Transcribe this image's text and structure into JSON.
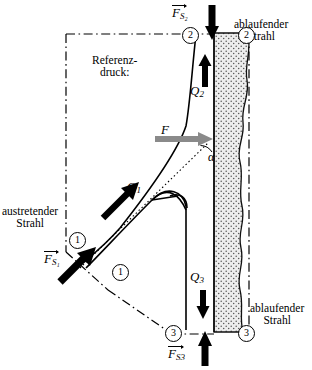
{
  "figure": {
    "type": "technical-diagram",
    "width": 312,
    "height": 370,
    "background": "#ffffff"
  },
  "labels": {
    "reference_pressure_line1": "Referenz-",
    "reference_pressure_line2": "druck:",
    "exiting_jet_line1": "austretender",
    "exiting_jet_line2": "Strahl",
    "running_jet_top_line1": "ablaufender",
    "running_jet_top_line2": "Strahl",
    "running_jet_bottom_line1": "ablaufender",
    "running_jet_bottom_line2": "Strahl",
    "angle_alpha": "α"
  },
  "flows": [
    {
      "name": "Q1",
      "symbol": "Q",
      "subscript": "1",
      "direction": "diagonal-up-right"
    },
    {
      "name": "Q2",
      "symbol": "Q",
      "subscript": "2",
      "direction": "up"
    },
    {
      "name": "Q3",
      "symbol": "Q",
      "subscript": "3",
      "direction": "down"
    }
  ],
  "forces": [
    {
      "name": "FS2",
      "symbol": "F",
      "subscript": "S₂",
      "vector": true,
      "direction": "down",
      "color": "#000000"
    },
    {
      "name": "FS1",
      "symbol": "F",
      "subscript": "S₁",
      "vector": true,
      "direction": "diagonal-up-right",
      "color": "#000000"
    },
    {
      "name": "FS3",
      "symbol": "F",
      "subscript": "S3",
      "vector": true,
      "direction": "up",
      "color": "#000000"
    },
    {
      "name": "F",
      "symbol": "F",
      "subscript": "",
      "vector": false,
      "direction": "right",
      "color": "#808080"
    }
  ],
  "station_markers": [
    {
      "id": "2-left",
      "number": "2"
    },
    {
      "id": "2-right",
      "number": "2"
    },
    {
      "id": "1-upper",
      "number": "1"
    },
    {
      "id": "1-lower",
      "number": "1"
    },
    {
      "id": "3-left",
      "number": "3"
    },
    {
      "id": "3-right",
      "number": "3"
    }
  ],
  "colors": {
    "outline": "#000000",
    "force_arrow_gray": "#808080",
    "jet_fill": "#e6e6e6",
    "dashdot": "#000000"
  }
}
